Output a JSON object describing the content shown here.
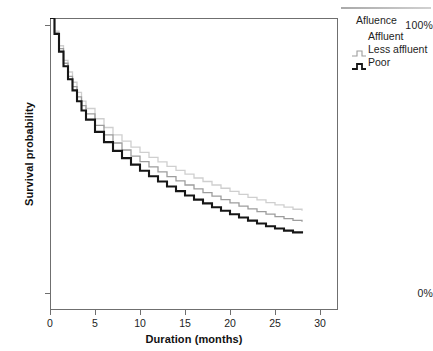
{
  "chart_data": {
    "type": "line",
    "subtype": "kaplan-meier-step",
    "title": "",
    "xlabel": "Duration (months)",
    "ylabel": "Survival probability",
    "xlim": [
      0,
      32
    ],
    "ylim": [
      0,
      1
    ],
    "xticks": [
      0,
      5,
      10,
      15,
      20,
      25,
      30
    ],
    "xticklabels": [
      "0",
      "5",
      "10",
      "15",
      "20",
      "25",
      "30"
    ],
    "yticks": [
      0,
      1
    ],
    "yticklabels": [
      "0%",
      "100%"
    ],
    "grid": false,
    "legend_position": "right-outside",
    "legend_title": "Afluence",
    "series": [
      {
        "name": "Affluent",
        "color": "#cfcfcf",
        "x": [
          0,
          0.5,
          1,
          1.5,
          2,
          2.5,
          3,
          3.5,
          4,
          5,
          6,
          7,
          8,
          9,
          10,
          11,
          12,
          13,
          14,
          15,
          16,
          17,
          18,
          19,
          20,
          21,
          22,
          23,
          24,
          25,
          26,
          27,
          28
        ],
        "values": [
          1.0,
          0.955,
          0.905,
          0.855,
          0.815,
          0.78,
          0.745,
          0.715,
          0.69,
          0.655,
          0.625,
          0.6,
          0.578,
          0.558,
          0.54,
          0.523,
          0.507,
          0.492,
          0.478,
          0.465,
          0.452,
          0.44,
          0.428,
          0.417,
          0.406,
          0.396,
          0.386,
          0.377,
          0.368,
          0.36,
          0.352,
          0.345,
          0.34
        ]
      },
      {
        "name": "Less affluent",
        "color": "#9d9d9d",
        "x": [
          0,
          0.5,
          1,
          1.5,
          2,
          2.5,
          3,
          3.5,
          4,
          5,
          6,
          7,
          8,
          9,
          10,
          11,
          12,
          13,
          14,
          15,
          16,
          17,
          18,
          19,
          20,
          21,
          22,
          23,
          24,
          25,
          26,
          27,
          28
        ],
        "values": [
          1.0,
          0.95,
          0.895,
          0.845,
          0.8,
          0.765,
          0.73,
          0.7,
          0.672,
          0.632,
          0.6,
          0.572,
          0.548,
          0.527,
          0.508,
          0.49,
          0.473,
          0.457,
          0.442,
          0.428,
          0.415,
          0.402,
          0.39,
          0.378,
          0.367,
          0.356,
          0.346,
          0.337,
          0.328,
          0.32,
          0.313,
          0.307,
          0.302
        ]
      },
      {
        "name": "Poor",
        "color": "#161616",
        "x": [
          0,
          0.5,
          1,
          1.5,
          2,
          2.5,
          3,
          3.5,
          4,
          5,
          6,
          7,
          8,
          9,
          10,
          11,
          12,
          13,
          14,
          15,
          16,
          17,
          18,
          19,
          20,
          21,
          22,
          23,
          24,
          25,
          26,
          27,
          28
        ],
        "values": [
          1.0,
          0.945,
          0.885,
          0.835,
          0.79,
          0.752,
          0.715,
          0.683,
          0.652,
          0.61,
          0.575,
          0.545,
          0.52,
          0.498,
          0.477,
          0.458,
          0.44,
          0.423,
          0.407,
          0.392,
          0.378,
          0.365,
          0.352,
          0.34,
          0.328,
          0.317,
          0.306,
          0.296,
          0.287,
          0.279,
          0.272,
          0.266,
          0.262
        ]
      }
    ]
  },
  "legend": {
    "title": "Afluence",
    "items": [
      {
        "label": "Affluent"
      },
      {
        "label": "Less affluent"
      },
      {
        "label": "Poor"
      }
    ]
  },
  "axes": {
    "y_title": "Survival probability",
    "x_title": "Duration (months)",
    "y_top_label": "100%",
    "y_bottom_label": "0%"
  }
}
